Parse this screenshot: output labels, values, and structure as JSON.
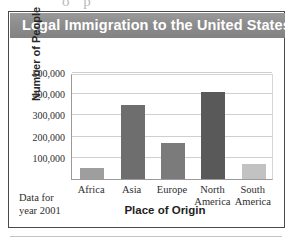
{
  "figure": {
    "title": "Legal Immigration to the United States",
    "note_lines": [
      "Data for",
      "year 2001"
    ],
    "title_bar_color": "#8d8d8d",
    "title_text_color": "#ffffff",
    "frame_color": "#4a4a4a",
    "artifact_top_text": "o p"
  },
  "chart_data": {
    "type": "bar",
    "title": "Legal Immigration to the United States",
    "xlabel": "Place of Origin",
    "ylabel": "Number of People",
    "categories": [
      "Africa",
      "Asia",
      "Europe",
      "North America",
      "South America"
    ],
    "values": [
      50000,
      350000,
      170000,
      410000,
      70000
    ],
    "bar_colors": [
      "#9e9e9e",
      "#6e6e6e",
      "#7b7b7b",
      "#595959",
      "#c2c2c2"
    ],
    "ylim": [
      0,
      500000
    ],
    "yticks": [
      100000,
      200000,
      300000,
      400000,
      500000
    ],
    "ytick_labels": [
      "100,000",
      "200,000",
      "300,000",
      "400,000",
      "500,000"
    ],
    "xtick_labels": [
      "Africa",
      "Asia",
      "Europe",
      "North\nAmerica",
      "South\nAmerica"
    ],
    "grid": true,
    "legend": "none"
  }
}
